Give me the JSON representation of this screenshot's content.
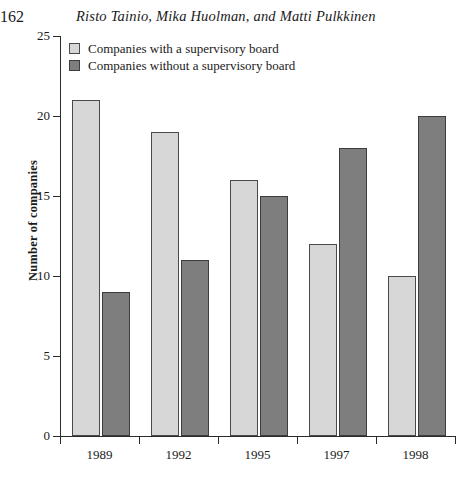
{
  "header": {
    "page_number": "162",
    "running_head": "Risto Tainio, Mika Huolman, and Matti Pulkkinen"
  },
  "chart_data": {
    "type": "bar",
    "title": "",
    "xlabel": "",
    "ylabel": "Number of companies",
    "categories": [
      "1989",
      "1992",
      "1995",
      "1997",
      "1998"
    ],
    "series": [
      {
        "name": "Companies with a supervisory board",
        "color": "#d7d7d7",
        "values": [
          21,
          19,
          16,
          12,
          10
        ]
      },
      {
        "name": "Companies without a supervisory board",
        "color": "#7e7e7e",
        "values": [
          9,
          11,
          15,
          18,
          20
        ]
      }
    ],
    "ylim": [
      0,
      25
    ],
    "yticks": [
      0,
      5,
      10,
      15,
      20,
      25
    ],
    "ytick_labels": [
      "0",
      "5",
      "10",
      "15",
      "20",
      "25"
    ],
    "grid": false,
    "legend_position": "top-left"
  }
}
